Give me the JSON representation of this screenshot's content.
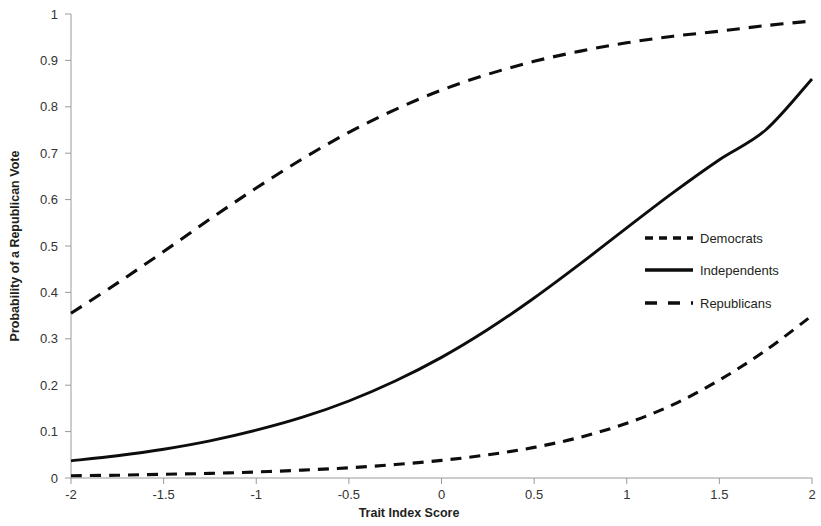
{
  "chart_data": {
    "type": "line",
    "title": "",
    "xlabel": "Trait Index Score",
    "ylabel": "Probability of a Republican Vote",
    "xlim": [
      -2,
      2
    ],
    "ylim": [
      0,
      1
    ],
    "grid": false,
    "legend_position": "right-middle",
    "xticks": [
      "-2",
      "-1.5",
      "-1",
      "-0.5",
      "0",
      "0.5",
      "1",
      "1.5",
      "2"
    ],
    "xtick_values": [
      -2,
      -1.5,
      -1,
      -0.5,
      0,
      0.5,
      1,
      1.5,
      2
    ],
    "yticks": [
      "0",
      "0.1",
      "0.2",
      "0.3",
      "0.4",
      "0.5",
      "0.6",
      "0.7",
      "0.8",
      "0.9",
      "1"
    ],
    "ytick_values": [
      0,
      0.1,
      0.2,
      0.3,
      0.4,
      0.5,
      0.6,
      0.7,
      0.8,
      0.9,
      1
    ],
    "x": [
      -2,
      -1.75,
      -1.5,
      -1.25,
      -1,
      -0.75,
      -0.5,
      -0.25,
      0,
      0.25,
      0.5,
      0.75,
      1,
      1.25,
      1.5,
      1.75,
      2
    ],
    "series": [
      {
        "name": "Democrats",
        "style": "dash-short",
        "color": "#0d0d0d",
        "values": [
          0.005,
          0.006,
          0.008,
          0.01,
          0.013,
          0.017,
          0.022,
          0.029,
          0.038,
          0.05,
          0.066,
          0.088,
          0.118,
          0.158,
          0.211,
          0.275,
          0.35
        ]
      },
      {
        "name": "Independents",
        "style": "solid",
        "color": "#0d0d0d",
        "values": [
          0.037,
          0.048,
          0.062,
          0.08,
          0.103,
          0.131,
          0.166,
          0.209,
          0.26,
          0.32,
          0.388,
          0.462,
          0.539,
          0.615,
          0.686,
          0.75,
          0.86
        ]
      },
      {
        "name": "Republicans",
        "style": "dash-long",
        "color": "#0d0d0d",
        "values": [
          0.355,
          0.42,
          0.488,
          0.558,
          0.625,
          0.688,
          0.745,
          0.794,
          0.836,
          0.87,
          0.898,
          0.92,
          0.938,
          0.952,
          0.963,
          0.975,
          0.985
        ]
      }
    ],
    "legend_entries": [
      {
        "label": "Democrats",
        "style": "dash-short"
      },
      {
        "label": "Independents",
        "style": "solid"
      },
      {
        "label": "Republicans",
        "style": "dash-long"
      }
    ]
  }
}
